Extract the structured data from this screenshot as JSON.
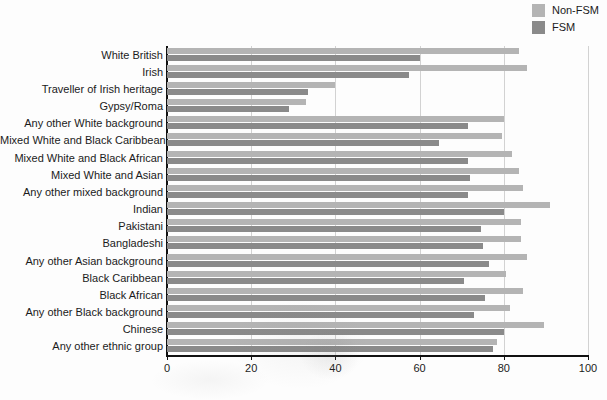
{
  "chart_data": {
    "type": "bar",
    "orientation": "horizontal",
    "title": "",
    "xlabel": "",
    "ylabel": "",
    "xlim": [
      0,
      100
    ],
    "xticks": [
      0,
      20,
      40,
      60,
      80,
      100
    ],
    "grid": true,
    "legend_position": "top-right",
    "categories": [
      "White British",
      "Irish",
      "Traveller of Irish heritage",
      "Gypsy/Roma",
      "Any other White background",
      "Mixed White and Black Caribbean",
      "Mixed White and Black African",
      "Mixed White and Asian",
      "Any other mixed background",
      "Indian",
      "Pakistani",
      "Bangladeshi",
      "Any other Asian background",
      "Black Caribbean",
      "Black African",
      "Any other Black background",
      "Chinese",
      "Any other ethnic group"
    ],
    "series": [
      {
        "name": "Non-FSM",
        "color": "#b4b4b4",
        "values": [
          83.5,
          85.5,
          40.0,
          33.0,
          80.0,
          79.5,
          82.0,
          83.5,
          84.5,
          91.0,
          84.0,
          84.0,
          85.5,
          80.5,
          84.5,
          81.5,
          89.5,
          78.5
        ]
      },
      {
        "name": "FSM",
        "color": "#8a8a8a",
        "values": [
          60.0,
          57.5,
          33.5,
          29.0,
          71.5,
          64.5,
          71.5,
          72.0,
          71.5,
          80.0,
          74.5,
          75.0,
          76.5,
          70.5,
          75.5,
          73.0,
          80.0,
          77.5
        ]
      }
    ]
  },
  "legend": {
    "items": [
      {
        "label": "Non-FSM",
        "color": "#b4b4b4"
      },
      {
        "label": "FSM",
        "color": "#8a8a8a"
      }
    ]
  },
  "colors": {
    "non_fsm": "#b4b4b4",
    "fsm": "#8a8a8a",
    "axis": "#111111",
    "gridline": "#d2d2d2",
    "background": "#fdfdfd",
    "text": "#1b1b1b"
  }
}
